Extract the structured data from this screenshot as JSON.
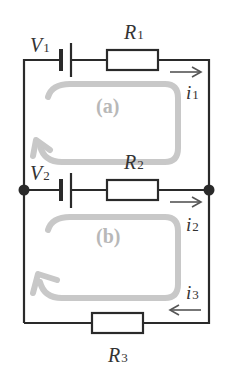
{
  "diagram": {
    "type": "circuit",
    "components": {
      "V1": {
        "symbol": "V",
        "sub": "1"
      },
      "V2": {
        "symbol": "V",
        "sub": "2"
      },
      "R1": {
        "symbol": "R",
        "sub": "1"
      },
      "R2": {
        "symbol": "R",
        "sub": "2"
      },
      "R3": {
        "symbol": "R",
        "sub": "3"
      }
    },
    "currents": {
      "i1": {
        "symbol": "i",
        "sub": "1",
        "direction": "right"
      },
      "i2": {
        "symbol": "i",
        "sub": "2",
        "direction": "right"
      },
      "i3": {
        "symbol": "i",
        "sub": "3",
        "direction": "left"
      }
    },
    "loops": {
      "a": {
        "label": "(a)",
        "direction": "clockwise"
      },
      "b": {
        "label": "(b)",
        "direction": "clockwise"
      }
    },
    "colors": {
      "wire": "#2a2a2a",
      "loop": "#c8c8c8",
      "loop_label": "#b8b8b8",
      "text": "#333333"
    }
  }
}
